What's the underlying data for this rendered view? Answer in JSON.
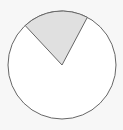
{
  "chart_data": {
    "type": "pie",
    "title": "",
    "categories": [
      "Shaded",
      "Unshaded"
    ],
    "values": [
      20,
      80
    ],
    "colors": [
      "#e0e0e0",
      "#ffffff"
    ],
    "outline_color": "#666666",
    "shaded_start_deg": 62,
    "shaded_end_deg": 133,
    "legend": "none"
  }
}
